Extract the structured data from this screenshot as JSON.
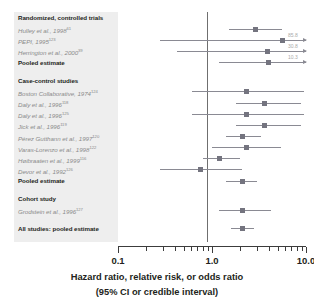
{
  "chart_data": {
    "type": "scatter",
    "subtype": "forest-plot",
    "title": "",
    "xlabel": "Hazard ratio, relative risk, or odds ratio",
    "xlabel2": "(95% CI or credible interval)",
    "xscale": "log",
    "xlim": [
      0.1,
      10.0
    ],
    "tick_labels": [
      "0.1",
      "1.0",
      "10.0"
    ],
    "tick_values": [
      0.1,
      1.0,
      10.0
    ],
    "null_line": 1.0,
    "grid": false,
    "legend": "none",
    "sections": [
      {
        "heading": "Randomized, controlled trials",
        "rows": [
          {
            "label": "Hulley et al., 1998",
            "ref": "61",
            "estimate": 2.89,
            "low": 1.5,
            "high": 5.6,
            "kind": "study",
            "truncated": false
          },
          {
            "label": "PEPI, 1995",
            "ref": "123",
            "estimate": 5.6,
            "low": 0.28,
            "high": 85.8,
            "kind": "study",
            "truncated": true,
            "high_label": "85.8"
          },
          {
            "label": "Herrington et al., 2000",
            "ref": "39",
            "estimate": 3.9,
            "low": 0.42,
            "high": 30.8,
            "kind": "study",
            "truncated": true,
            "high_label": "30.8"
          },
          {
            "label": "Pooled estimate",
            "ref": "",
            "estimate": 4.0,
            "low": 1.2,
            "high": 10.3,
            "kind": "pooled",
            "truncated": true,
            "high_label": "10.3"
          }
        ]
      },
      {
        "heading": "Case-control studies",
        "rows": [
          {
            "label": "Boston Collaborative, 1974",
            "ref": "124",
            "estimate": 2.3,
            "low": 0.62,
            "high": 9.6,
            "kind": "study",
            "truncated": false
          },
          {
            "label": "Daly et al., 1996",
            "ref": "118",
            "estimate": 3.6,
            "low": 1.8,
            "high": 8.8,
            "kind": "study",
            "truncated": false
          },
          {
            "label": "Daly et al., 1996",
            "ref": "125",
            "estimate": 2.3,
            "low": 0.62,
            "high": 9.6,
            "kind": "study",
            "truncated": false
          },
          {
            "label": "Jick et al., 1996",
            "ref": "119",
            "estimate": 3.6,
            "low": 1.8,
            "high": 8.8,
            "kind": "study",
            "truncated": false
          },
          {
            "label": "Pérez Gutthann et al., 1997",
            "ref": "120",
            "estimate": 2.1,
            "low": 1.4,
            "high": 3.3,
            "kind": "study",
            "truncated": false
          },
          {
            "label": "Varas-Lorenzo et al., 1998",
            "ref": "122",
            "estimate": 2.3,
            "low": 1.0,
            "high": 5.4,
            "kind": "study",
            "truncated": false
          },
          {
            "label": "Høibraaten et al., 1999",
            "ref": "116",
            "estimate": 1.2,
            "low": 0.8,
            "high": 2.0,
            "kind": "study",
            "truncated": false
          },
          {
            "label": "Devor et al., 1992",
            "ref": "126",
            "estimate": 0.75,
            "low": 0.28,
            "high": 2.1,
            "kind": "study",
            "truncated": false
          },
          {
            "label": "Pooled estimate",
            "ref": "",
            "estimate": 2.1,
            "low": 1.4,
            "high": 3.0,
            "kind": "pooled",
            "truncated": false
          }
        ]
      },
      {
        "heading": "Cohort study",
        "rows": [
          {
            "label": "Grodstein et al., 1996",
            "ref": "127",
            "estimate": 2.1,
            "low": 1.2,
            "high": 4.2,
            "kind": "study",
            "truncated": false
          }
        ]
      },
      {
        "heading": "",
        "rows": [
          {
            "label": "All studies: pooled estimate",
            "ref": "",
            "estimate": 2.1,
            "low": 1.6,
            "high": 2.8,
            "kind": "pooled",
            "truncated": false
          }
        ]
      }
    ]
  },
  "colors": {
    "panel": "#eeeeee",
    "marker": "#74747f",
    "ci": "#8a8a93",
    "null_line": "#6f6f6f",
    "axis": "#3c3c3c",
    "study_text": "#8b8b8b",
    "head_text": "#231f20",
    "off_label": "#a9a9a9"
  }
}
